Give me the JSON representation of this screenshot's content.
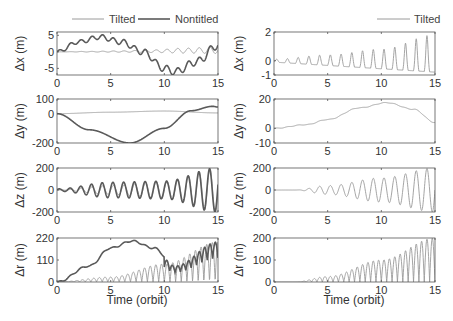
{
  "figure": {
    "colors": {
      "tilted": "#9a9a9a",
      "nontilted": "#5a5a5a",
      "axis": "#555555"
    },
    "left_legend": {
      "tilted": "Tilted",
      "nontilted": "Nontitled"
    },
    "right_legend": {
      "tilted": "Tilted"
    },
    "xlabel": "Time (orbit)"
  },
  "chart_data": [
    {
      "type": "line",
      "panel": "left-1",
      "title": "",
      "xlabel": "",
      "ylabel": "Δx (m)",
      "xlim": [
        0,
        15
      ],
      "ylim": [
        -7,
        6
      ],
      "yticks": [
        5,
        0,
        -5
      ],
      "xticks": [
        0,
        5,
        10,
        15
      ],
      "legend": [
        "Tilted",
        "Nontitled"
      ],
      "legend_position": "top",
      "series": [
        {
          "name": "Tilted",
          "description": "oscillation around 0, amplitude growing from ~0 to ~2",
          "x": [
            0,
            3,
            6,
            9,
            12,
            15
          ],
          "values": [
            0,
            0.2,
            0.4,
            0.8,
            1.5,
            2
          ]
        },
        {
          "name": "Nontitled",
          "description": "rises to ~4.5 near t=3-4, crosses 0 near t=8, min ~-6 near t=11, back to ~2 at t=15",
          "x": [
            0,
            2,
            4,
            6,
            8,
            10,
            11,
            13,
            15
          ],
          "values": [
            0,
            3,
            4.5,
            3,
            0,
            -5,
            -6,
            -3,
            2
          ]
        }
      ]
    },
    {
      "type": "line",
      "panel": "left-2",
      "ylabel": "Δy (m)",
      "xlim": [
        0,
        15
      ],
      "ylim": [
        -200,
        100
      ],
      "yticks": [
        100,
        0,
        -200
      ],
      "xticks": [
        0,
        5,
        10,
        15
      ],
      "series": [
        {
          "name": "Tilted",
          "x": [
            0,
            5,
            10,
            15
          ],
          "values": [
            0,
            10,
            18,
            5
          ]
        },
        {
          "name": "Nontitled",
          "x": [
            0,
            3,
            6.8,
            10,
            12.5,
            14.5,
            15
          ],
          "values": [
            0,
            -110,
            -200,
            -100,
            20,
            50,
            45
          ]
        }
      ]
    },
    {
      "type": "line",
      "panel": "left-3",
      "ylabel": "Δz (m)",
      "xlim": [
        0,
        15
      ],
      "ylim": [
        -200,
        200
      ],
      "yticks": [
        200,
        0,
        -200
      ],
      "xticks": [
        0,
        5,
        10,
        15
      ],
      "series": [
        {
          "name": "Tilted",
          "description": "oscillation with growing amplitude up to ~200",
          "amplitude_x": [
            0,
            5,
            10,
            15
          ],
          "amplitude": [
            0,
            40,
            80,
            200
          ]
        },
        {
          "name": "Nontitled",
          "description": "oscillation with amplitude ~80 mid, ~200 at end",
          "amplitude_x": [
            0,
            5,
            10,
            15
          ],
          "amplitude": [
            10,
            70,
            80,
            200
          ]
        }
      ]
    },
    {
      "type": "line",
      "panel": "left-4",
      "ylabel": "Δr (m)",
      "xlabel": "Time (orbit)",
      "xlim": [
        0,
        15
      ],
      "ylim": [
        0,
        220
      ],
      "yticks": [
        220,
        110,
        0
      ],
      "xticks": [
        0,
        5,
        10,
        15
      ],
      "series": [
        {
          "name": "Tilted",
          "description": "rectified oscillation, envelope grows to ~200",
          "x": [
            0,
            5,
            10,
            15
          ],
          "values": [
            0,
            25,
            90,
            200
          ]
        },
        {
          "name": "Nontitled",
          "description": "hump peaking ~205 near t=7, then rectified oscillation",
          "x": [
            0,
            3,
            5,
            7,
            9,
            11,
            15
          ],
          "values": [
            0,
            80,
            170,
            205,
            170,
            80,
            200
          ]
        }
      ]
    },
    {
      "type": "line",
      "panel": "right-1",
      "ylabel": "Δx (m)",
      "xlim": [
        0,
        15
      ],
      "ylim": [
        -1,
        2
      ],
      "yticks": [
        2,
        0,
        -1
      ],
      "xticks": [
        0,
        5,
        10,
        15
      ],
      "legend": [
        "Tilted"
      ],
      "legend_position": "top-right",
      "series": [
        {
          "name": "Tilted",
          "description": "oscillation, peaks grow from ~0.1 to ~1.8, troughs ~-0.8",
          "x": [
            0,
            5,
            10,
            15
          ],
          "values": [
            0.1,
            0.4,
            0.8,
            1.8
          ]
        }
      ]
    },
    {
      "type": "line",
      "panel": "right-2",
      "ylabel": "Δy (m)",
      "xlim": [
        0,
        15
      ],
      "ylim": [
        -10,
        20
      ],
      "yticks": [
        20,
        0,
        -10
      ],
      "xticks": [
        0,
        5,
        10,
        15
      ],
      "series": [
        {
          "name": "Tilted",
          "x": [
            0,
            3,
            5,
            8,
            10.5,
            13,
            15
          ],
          "values": [
            0,
            2.5,
            6,
            14,
            17.5,
            13,
            4
          ]
        }
      ]
    },
    {
      "type": "line",
      "panel": "right-3",
      "ylabel": "Δz (m)",
      "xlim": [
        0,
        15
      ],
      "ylim": [
        -200,
        200
      ],
      "yticks": [
        200,
        0,
        -200
      ],
      "xticks": [
        0,
        5,
        10,
        15
      ],
      "series": [
        {
          "name": "Tilted",
          "description": "oscillation starting ~t=2, amplitude grows to ~200",
          "amplitude_x": [
            0,
            2,
            5,
            10,
            15
          ],
          "amplitude": [
            0,
            0,
            40,
            110,
            200
          ]
        }
      ]
    },
    {
      "type": "line",
      "panel": "right-4",
      "ylabel": "Δr (m)",
      "xlabel": "Time (orbit)",
      "xlim": [
        0,
        15
      ],
      "ylim": [
        0,
        200
      ],
      "yticks": [
        200,
        100,
        0
      ],
      "xticks": [
        0,
        5,
        10,
        15
      ],
      "series": [
        {
          "name": "Tilted",
          "description": "rectified oscillation, envelope grows to ~200",
          "x": [
            0,
            2,
            5,
            10,
            15
          ],
          "values": [
            0,
            0,
            25,
            100,
            200
          ]
        }
      ]
    }
  ]
}
